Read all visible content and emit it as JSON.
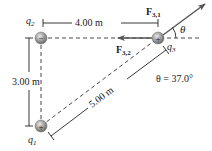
{
  "charges": {
    "q1": {
      "label": "q",
      "sub": "1",
      "sign": "+"
    },
    "q2": {
      "label": "q",
      "sub": "2",
      "sign": "−"
    },
    "q3": {
      "label": "q",
      "sub": "3",
      "sign": "+"
    }
  },
  "dimensions": {
    "horizontal": "4.00 m",
    "vertical": "3.00 m",
    "diagonal": "5.00 m"
  },
  "forces": {
    "f31": {
      "label": "F",
      "sub": "3,1"
    },
    "f32": {
      "label": "F",
      "sub": "3,2"
    }
  },
  "angle": {
    "symbol": "θ",
    "annotation": "θ = 37.0°"
  },
  "colors": {
    "charge_fill": "#9a9a9a",
    "arrow": "#555555",
    "line": "#222222"
  }
}
